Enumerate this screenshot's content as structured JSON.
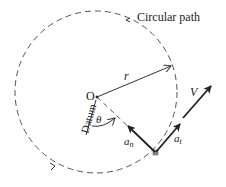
{
  "diagram": {
    "path_label": "Circular path",
    "origin_label": "O",
    "radius_label": "r",
    "angle_label": "θ",
    "datum_label": "Datum",
    "velocity_label": "V",
    "normal_accel_label": "a",
    "normal_accel_sub": "n",
    "tangential_accel_label": "a",
    "tangential_accel_sub": "t"
  },
  "colors": {
    "stroke": "#333333",
    "point": "#888888"
  }
}
